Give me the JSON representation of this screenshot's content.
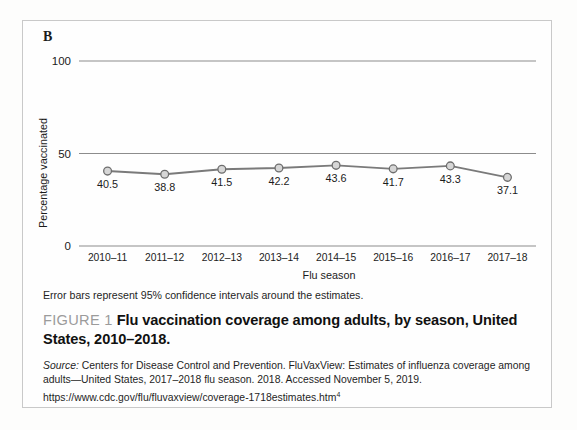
{
  "panel": {
    "letter": "B"
  },
  "chart_data": {
    "type": "line",
    "title": "",
    "xlabel": "Flu season",
    "ylabel": "Percentage vaccinated",
    "categories": [
      "2010–11",
      "2011–12",
      "2012–13",
      "2013–14",
      "2014–15",
      "2015–16",
      "2016–17",
      "2017–18"
    ],
    "values": [
      40.5,
      38.8,
      41.5,
      42.2,
      43.6,
      41.7,
      43.3,
      37.1
    ],
    "point_labels": [
      "40.5",
      "38.8",
      "41.5",
      "42.2",
      "43.6",
      "41.7",
      "43.3",
      "37.1"
    ],
    "ylim": [
      0,
      100
    ],
    "yticks": [
      0,
      50,
      100
    ],
    "ytick_labels": [
      "0",
      "50",
      "100"
    ],
    "grid": "horizontal",
    "legend": "none",
    "series_color": "#7a7a7a",
    "marker_fill": "#d6d6d6",
    "marker_edge": "#6e6e6e"
  },
  "notes": {
    "error_bars": "Error bars represent 95% confidence intervals around the estimates."
  },
  "caption": {
    "figure_label": "FIGURE 1",
    "title": "Flu vaccination coverage among adults, by season, United States, 2010–2018."
  },
  "source": {
    "prefix": "Source:",
    "text": "Centers for Disease Control and Prevention. FluVaxView: Estimates of influenza coverage among adults—United States, 2017–2018 flu season. 2018. Accessed November 5, 2019. https://www.cdc.gov/flu/fluvaxview/coverage-1718estimates.htm",
    "superscript": "4"
  }
}
